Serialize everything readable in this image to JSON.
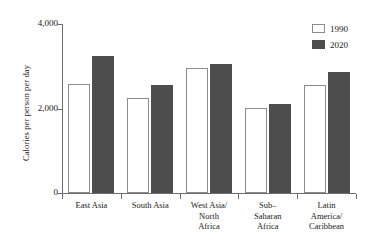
{
  "chart_data": {
    "type": "bar",
    "title": "",
    "xlabel": "",
    "ylabel": "Calories per person per day",
    "ylim": [
      0,
      4000
    ],
    "ytick_labels": [
      "4,000",
      "2,000",
      "0"
    ],
    "ytick_values": [
      4000,
      2000,
      0
    ],
    "grid": false,
    "legend_position": "top-right",
    "categories": [
      "East Asia",
      "South Asia",
      "West Asia/ North Africa",
      "Sub- Saharan Africa",
      "Latin America/ Caribbean"
    ],
    "category_lines": [
      [
        "East Asia"
      ],
      [
        "South Asia"
      ],
      [
        "West Asia/",
        "North",
        "Africa"
      ],
      [
        "Sub–",
        "Saharan",
        "Africa"
      ],
      [
        "Latin",
        "America/",
        "Caribbean"
      ]
    ],
    "series": [
      {
        "name": "1990",
        "color": "#ffffff",
        "values": [
          2580,
          2250,
          2960,
          2010,
          2560
        ]
      },
      {
        "name": "2020",
        "color": "#4d4d4d",
        "values": [
          3240,
          2560,
          3050,
          2100,
          2860
        ]
      }
    ]
  },
  "legend": {
    "items": [
      {
        "label": "1990"
      },
      {
        "label": "2020"
      }
    ]
  },
  "axes": {
    "y_title": "Calories per person per day"
  }
}
